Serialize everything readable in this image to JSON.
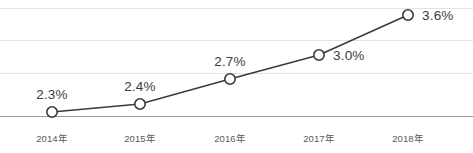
{
  "chart_data": {
    "type": "line",
    "title": "",
    "subtitle": "",
    "xlabel": "",
    "ylabel": "",
    "categories": [
      "2014年",
      "2015年",
      "2016年",
      "2017年",
      "2018年"
    ],
    "values": [
      2.3,
      2.4,
      2.7,
      3.0,
      3.6
    ],
    "point_labels": [
      "2.3%",
      "2.4%",
      "2.7%",
      "3.0%",
      "3.6%"
    ],
    "label_positions": [
      "above",
      "above",
      "above",
      "right",
      "right"
    ],
    "series": [
      {
        "name": "",
        "values": [
          2.3,
          2.4,
          2.7,
          3.0,
          3.6
        ]
      }
    ],
    "ylim": [
      2.2,
      3.75
    ],
    "yticks": [],
    "grid": true,
    "gridlines": 4,
    "legend": "none",
    "marker": "open-circle",
    "line_color": "#3b3b3b",
    "marker_fill": "#ffffff",
    "grid_color": "#e3e3e3",
    "axis_color": "#9a9a9a",
    "label_color": "#3b3b3b",
    "tick_color": "#595959"
  },
  "chart": {
    "points": [
      {
        "x": 52,
        "y": 112,
        "label": "2.3%",
        "lx": 52,
        "ly": 87,
        "pos": "above"
      },
      {
        "x": 140,
        "y": 104,
        "label": "2.4%",
        "lx": 140,
        "ly": 79,
        "pos": "above"
      },
      {
        "x": 230,
        "y": 79,
        "label": "2.7%",
        "lx": 230,
        "ly": 54,
        "pos": "above"
      },
      {
        "x": 319,
        "y": 55,
        "label": "3.0%",
        "lx": 333,
        "ly": 48,
        "pos": "right"
      },
      {
        "x": 408,
        "y": 15,
        "label": "3.6%",
        "lx": 422,
        "ly": 8,
        "pos": "right"
      }
    ],
    "gridlines_y": [
      8,
      40,
      73,
      116
    ],
    "xticks": [
      {
        "label": "2014年",
        "cx": 52
      },
      {
        "label": "2015年",
        "cx": 140
      },
      {
        "label": "2016年",
        "cx": 230
      },
      {
        "label": "2017年",
        "cx": 319
      },
      {
        "label": "2018年",
        "cx": 408
      }
    ]
  }
}
